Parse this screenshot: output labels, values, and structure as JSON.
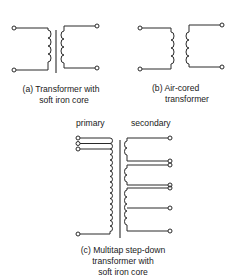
{
  "figure": {
    "panel_a": {
      "caption_line1": "(a) Transformer with",
      "caption_line2": "soft iron core",
      "core": "soft iron"
    },
    "panel_b": {
      "caption_line1": "(b) Air-cored",
      "caption_line2": "transformer",
      "core": "air"
    },
    "panel_c": {
      "label_primary": "primary",
      "label_secondary": "secondary",
      "caption_line1": "(c) Multitap step-down",
      "caption_line2": "transformer with",
      "caption_line3": "soft iron core",
      "primary_terminals": 4,
      "secondary_windings": 3,
      "secondary_terminals": 7
    }
  },
  "colors": {
    "line": "#2a2a2a",
    "background": "#ffffff"
  }
}
